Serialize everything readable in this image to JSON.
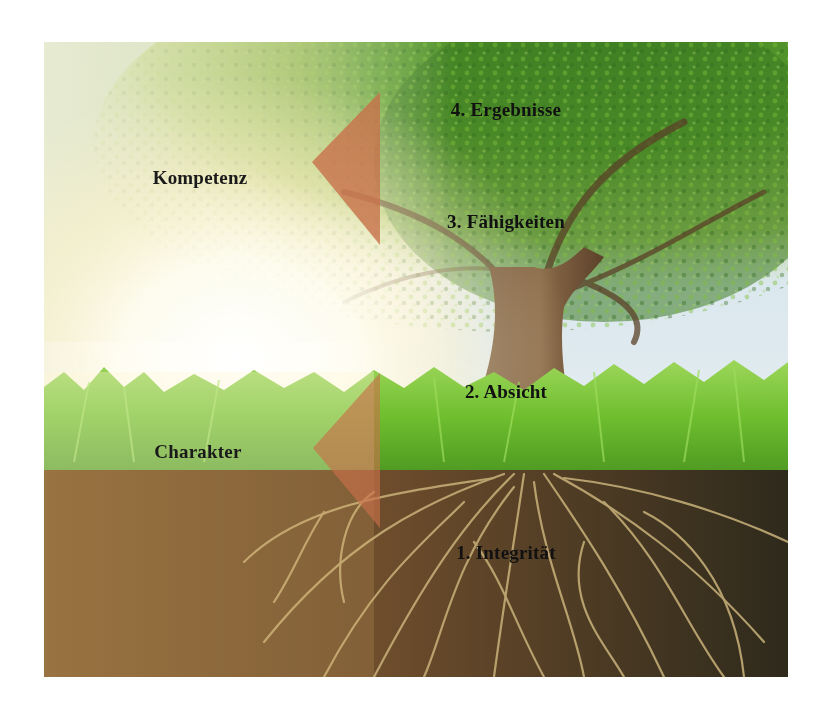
{
  "diagram": {
    "type": "tree-metaphor",
    "colors": {
      "sky": "#d6e5ec",
      "foliage_light": "#8fbf3e",
      "foliage_dark": "#2f6f1e",
      "trunk": "#7a5a3c",
      "grass": "#6fbf2f",
      "soil": "#6b4a2a",
      "roots": "#c9b27a",
      "arrow": "#c8704a",
      "text": "#111111"
    },
    "groups": [
      {
        "label": "Kompetenz",
        "arrow": "arrow-left"
      },
      {
        "label": "Charakter",
        "arrow": "arrow-left"
      }
    ],
    "levels": [
      {
        "label": "4. Ergebnisse"
      },
      {
        "label": "3. Fähigkeiten"
      },
      {
        "label": "2. Absicht"
      },
      {
        "label": "1. Integrität"
      }
    ]
  }
}
